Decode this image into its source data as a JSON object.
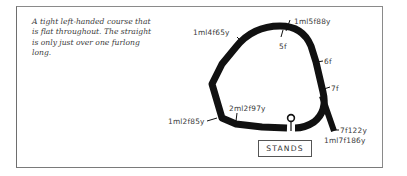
{
  "description": "A tight left-handed course that is flat throughout. The straight is only just over one furlong long.",
  "stands_label": "STANDS",
  "markers": [
    {
      "id": "1ml4f65y",
      "label": "1ml4f65y"
    },
    {
      "id": "1ml5f88y",
      "label": "1ml5f88y"
    },
    {
      "id": "5f",
      "label": "5f"
    },
    {
      "id": "6f",
      "label": "6f"
    },
    {
      "id": "7f",
      "label": "7f"
    },
    {
      "id": "7f122y",
      "label": "7f122y"
    },
    {
      "id": "1ml7f186y",
      "label": "1ml7f186y"
    },
    {
      "id": "2ml2f97y",
      "label": "2ml2f97y"
    },
    {
      "id": "1ml2f85y",
      "label": "1ml2f85y"
    }
  ],
  "colors": {
    "track": "#111111",
    "text": "#3a3a3a",
    "frame": "#8a8a8a"
  }
}
